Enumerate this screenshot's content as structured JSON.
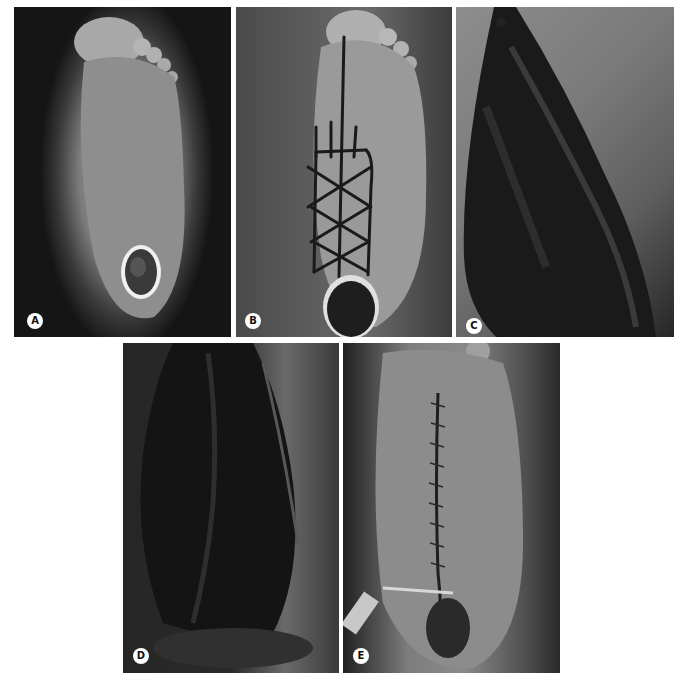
{
  "figure": {
    "panels": [
      {
        "id": "A",
        "label": "A",
        "description": "Plantar view of foot with heel ulcer"
      },
      {
        "id": "B",
        "label": "B",
        "description": "Foot sole with surgical markings in cross-hatch pattern above heel wound"
      },
      {
        "id": "C",
        "label": "C",
        "description": "Raised plantar flap, dark tissue exposed"
      },
      {
        "id": "D",
        "label": "D",
        "description": "Flap dissection with exposed dark tissue"
      },
      {
        "id": "E",
        "label": "E",
        "description": "Sutured foot sole after flap closure with drain"
      }
    ],
    "badge_colors": {
      "background": "#ffffff",
      "text": "#111111"
    },
    "caption": ""
  }
}
